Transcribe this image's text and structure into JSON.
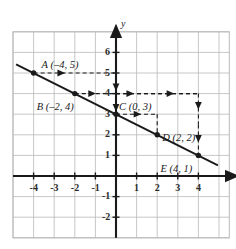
{
  "chart_data": {
    "type": "line",
    "title": "",
    "xlabel": "x",
    "ylabel": "y",
    "xlim": [
      -5,
      5.5
    ],
    "ylim": [
      -3,
      7
    ],
    "grid": true,
    "legend": "none",
    "x_ticks": [
      "-4",
      "-3",
      "-2",
      "-1",
      "1",
      "2",
      "3",
      "4"
    ],
    "x_tick_values": [
      -4,
      -3,
      -2,
      -1,
      1,
      2,
      3,
      4
    ],
    "y_ticks": [
      "6",
      "5",
      "4",
      "3",
      "2",
      "1",
      "-1",
      "-2"
    ],
    "y_tick_values": [
      6,
      5,
      4,
      3,
      2,
      1,
      -1,
      -2
    ],
    "line": {
      "slope": -0.5,
      "intercept": 3,
      "equation_points": [
        [
          -4,
          5
        ],
        [
          4,
          1
        ]
      ],
      "draw_from": [
        -4.85,
        5.42
      ],
      "draw_to": [
        4.95,
        0.52
      ]
    },
    "points": [
      {
        "id": "A",
        "label": "A (–4, 5)",
        "x": -4,
        "y": 5,
        "label_dx": 8,
        "label_dy": -13
      },
      {
        "id": "B",
        "label": "B (–2, 4)",
        "x": -2,
        "y": 4,
        "label_dx": -38,
        "label_dy": 8
      },
      {
        "id": "C",
        "label": "C (0, 3)",
        "x": 0,
        "y": 3,
        "label_dx": 3,
        "label_dy": -12
      },
      {
        "id": "D",
        "label": "D (2, 2)",
        "x": 2,
        "y": 2,
        "label_dx": 5,
        "label_dy": -2
      },
      {
        "id": "E",
        "label": "E (4, 1)",
        "x": 4,
        "y": 1,
        "label_dx": -38,
        "label_dy": 9
      }
    ],
    "dashed_paths": [
      {
        "name": "a-to-yaxis",
        "from": [
          -4,
          5
        ],
        "to": [
          0,
          5
        ],
        "arrow": "right",
        "arrow_at": [
          -2.6,
          5
        ]
      },
      {
        "name": "yaxis-5-to-4",
        "from": [
          0,
          5
        ],
        "to": [
          0,
          4
        ],
        "arrow": "down",
        "arrow_at": [
          0,
          4.25
        ]
      },
      {
        "name": "b-to-yaxis",
        "from": [
          -2,
          4
        ],
        "to": [
          0,
          4
        ],
        "arrow": "right",
        "arrow_at": [
          -1.1,
          4
        ]
      },
      {
        "name": "yaxis-4-to-3",
        "from": [
          0,
          4
        ],
        "to": [
          0,
          3
        ],
        "arrow": "down",
        "arrow_at": [
          0,
          3.25
        ]
      },
      {
        "name": "yaxis-4-to-x4",
        "from": [
          0,
          4
        ],
        "to": [
          4,
          4
        ],
        "arrow": "right",
        "arrow_at": [
          0.75,
          4
        ]
      },
      {
        "name": "yaxis-4-to-x4-b",
        "from": [
          0,
          4
        ],
        "to": [
          4,
          4
        ],
        "arrow": "right",
        "arrow_at": [
          2.7,
          4
        ]
      },
      {
        "name": "c-to-x2",
        "from": [
          0,
          3
        ],
        "to": [
          2,
          3
        ],
        "arrow": "right",
        "arrow_at": [
          1.1,
          3
        ]
      },
      {
        "name": "x2-down-to-d",
        "from": [
          2,
          3
        ],
        "to": [
          2,
          2
        ],
        "arrow": "none",
        "arrow_at": [
          2,
          2
        ]
      },
      {
        "name": "x4-down-upper",
        "from": [
          4,
          4
        ],
        "to": [
          4,
          2.5
        ],
        "arrow": "down",
        "arrow_at": [
          4,
          3.35
        ]
      },
      {
        "name": "x4-down-lower",
        "from": [
          4,
          2.5
        ],
        "to": [
          4,
          1
        ],
        "arrow": "down",
        "arrow_at": [
          4,
          1.75
        ]
      }
    ]
  },
  "axes": {
    "x_axis_label": "x",
    "y_axis_label": "y"
  }
}
